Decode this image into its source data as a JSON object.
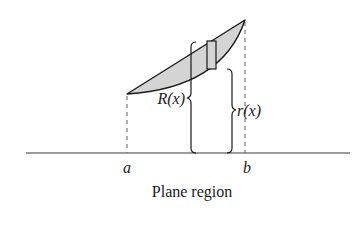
{
  "diagram": {
    "caption": "Plane region",
    "labels": {
      "a": "a",
      "b": "b",
      "outer_radius": "R(x)",
      "inner_radius": "r(x)"
    },
    "colors": {
      "region_fill": "#d4d4d4",
      "stroke": "#1a1a1a",
      "dashed": "#7a7a7a"
    }
  }
}
